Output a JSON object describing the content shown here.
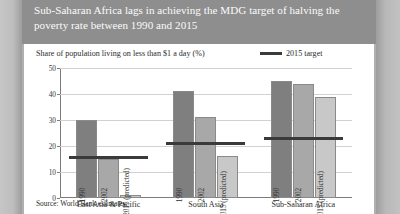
{
  "header": {
    "title": "Sub-Saharan Africa lags in achieving the MDG target of halving the poverty rate between 1990 and 2015"
  },
  "panel": {
    "subtitle": "Share of population living on less than $1 a day (%)",
    "source": "Source: World Bank estimates"
  },
  "legend": {
    "target_label": "2015 target"
  },
  "chart_data": {
    "type": "bar",
    "title": "Sub-Saharan Africa lags in achieving the MDG target of halving the poverty rate between 1990 and 2015",
    "subtitle": "Share of population living on less than $1 a day (%)",
    "xlabel": "",
    "ylabel": "Share of population living on less than $1 a day (%)",
    "ylim": [
      0,
      50
    ],
    "yticks": [
      0,
      10,
      20,
      30,
      40,
      50
    ],
    "ytick_labels": [
      "0",
      "10",
      "20",
      "30",
      "40",
      "50"
    ],
    "grid": true,
    "legend_position": "top-right",
    "categories": [
      "East Asia & Pacific",
      "South Asia",
      "Sub-Saharan Africa"
    ],
    "series": [
      {
        "name": "1990",
        "values": [
          30,
          41,
          45
        ]
      },
      {
        "name": "2002",
        "values": [
          15,
          31,
          44
        ]
      },
      {
        "name": "2015 (predicted)",
        "values": [
          1,
          16,
          39
        ]
      }
    ],
    "target_series": {
      "name": "2015 target",
      "values": [
        15,
        20.5,
        22.5
      ]
    },
    "colors": {
      "bar_1990": "#7f7f7f",
      "bar_2002": "#a8a8a8",
      "bar_2015": "#c8c8c8",
      "target_line": "#3a3a3a",
      "gridline": "#d2d2d2",
      "panel_background": "#ffffff",
      "header_band": "#8e8e8e"
    }
  }
}
